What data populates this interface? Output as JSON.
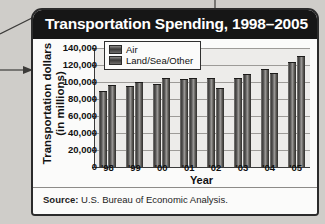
{
  "title": "Transportation Spending, 1998–2005",
  "source": {
    "label": "Source:",
    "text": "U.S. Bureau of Economic Analysis."
  },
  "legend": {
    "items": [
      "Air",
      "Land/Sea/Other"
    ]
  },
  "axis": {
    "ylabel_line1": "Transportation dollars",
    "ylabel_line2": "(in millions)",
    "xlabel": "Year",
    "yticks": [
      "140,000",
      "120,000",
      "100,000",
      "80,000",
      "60,000",
      "40,000",
      "20,000",
      "0"
    ],
    "xticks": [
      "'98",
      "'99",
      "'00",
      "'01",
      "'02",
      "'03",
      "'04",
      "'05"
    ]
  },
  "colors": {
    "title_bar": "#161616",
    "title_text": "#ffffff",
    "card_bg": "#f4f3f1",
    "plot_bg": "#edecea",
    "bar_dark": "#3b3a39",
    "bar_light": "#9a9896",
    "axis": "#3a3a3a",
    "grid": "#9d9b98",
    "page_bg": "#cfcdc9"
  },
  "chart_data": {
    "type": "bar",
    "title": "Transportation Spending, 1998–2005",
    "xlabel": "Year",
    "ylabel": "Transportation dollars (in millions)",
    "categories": [
      "'98",
      "'99",
      "'00",
      "'01",
      "'02",
      "'03",
      "'04",
      "'05"
    ],
    "series": [
      {
        "name": "Air",
        "values": [
          88000,
          94000,
          97000,
          102000,
          104000,
          104000,
          114000,
          122000
        ]
      },
      {
        "name": "Land/Sea/Other",
        "values": [
          95000,
          99000,
          103000,
          104000,
          92000,
          108000,
          110000,
          130000
        ]
      }
    ],
    "ylim": [
      0,
      140000
    ],
    "ytick_step": 20000,
    "grid": true,
    "legend_position": "top-left"
  }
}
